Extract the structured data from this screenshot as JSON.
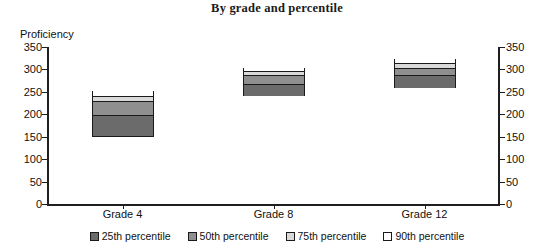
{
  "chart_data": {
    "type": "bar",
    "title": "By grade and percentile",
    "xlabel": "",
    "ylabel": "Proficiency",
    "stacked": true,
    "grid": false,
    "legend_position": "bottom",
    "ylim": [
      0,
      350
    ],
    "y_ticks": [
      0,
      50,
      100,
      150,
      200,
      250,
      300,
      350
    ],
    "dual_axis": true,
    "y_ticks_right": [
      0,
      50,
      100,
      150,
      200,
      250,
      300,
      350
    ],
    "categories": [
      "Grade 4",
      "Grade 8",
      "Grade 12"
    ],
    "series": [
      {
        "name": "25th percentile",
        "color": "#6b6b6b",
        "values": [
          195,
          265,
          283
        ],
        "base": [
          150,
          240,
          258
        ]
      },
      {
        "name": "50th percentile",
        "color": "#8f8f8f",
        "values": [
          225,
          283,
          300
        ]
      },
      {
        "name": "75th percentile",
        "color": "#d9d9d9",
        "values": [
          237,
          292,
          310
        ]
      },
      {
        "name": "90th percentile",
        "color": "#ffffff",
        "values": [
          253,
          303,
          323
        ]
      }
    ],
    "bar_bottoms": [
      150,
      240,
      258
    ],
    "bar_tops": [
      253,
      303,
      323
    ]
  },
  "legend": {
    "items": [
      {
        "label": "25th percentile",
        "color": "#6b6b6b"
      },
      {
        "label": "50th percentile",
        "color": "#8f8f8f"
      },
      {
        "label": "75th percentile",
        "color": "#d9d9d9"
      },
      {
        "label": "90th percentile",
        "color": "#ffffff"
      }
    ]
  },
  "axis": {
    "ylabel": "Proficiency",
    "ticks": [
      "350",
      "300",
      "250",
      "200",
      "150",
      "100",
      "50",
      "0"
    ],
    "xlabels": [
      "Grade 4",
      "Grade 8",
      "Grade 12"
    ]
  }
}
